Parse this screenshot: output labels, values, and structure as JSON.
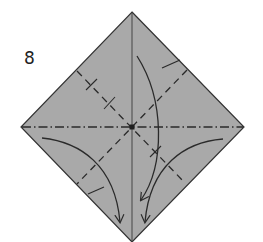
{
  "diagram": {
    "type": "origami-instruction-step",
    "step_number": "8",
    "paper": {
      "shape": "square-rotated-45",
      "fill_color": "#a9a9a9",
      "outline_color": "#333333",
      "corners": {
        "top": [
          132,
          12
        ],
        "right": [
          244,
          127
        ],
        "bottom": [
          132,
          242
        ],
        "left": [
          21,
          127
        ]
      },
      "center": [
        132,
        127
      ]
    },
    "creases": [
      {
        "name": "vertical-center-crease",
        "style": "solid-thin",
        "from": "top",
        "to": "bottom"
      },
      {
        "name": "horizontal-mountain-fold",
        "style": "dash-dot",
        "from": "left",
        "to": "right"
      },
      {
        "name": "diagonal-valley-fold-nw-se",
        "style": "dashed",
        "from": [
          77,
          71
        ],
        "to": [
          185,
          180
        ]
      },
      {
        "name": "diagonal-valley-fold-ne-sw",
        "style": "dashed",
        "from": [
          187,
          70
        ],
        "to": [
          77,
          184
        ]
      }
    ],
    "reference_ticks": [
      {
        "name": "tick-upper-left-1",
        "at": [
          91,
          84
        ]
      },
      {
        "name": "tick-upper-left-2",
        "at": [
          109,
          103
        ]
      },
      {
        "name": "tick-lower-right",
        "at": [
          155,
          152
        ]
      },
      {
        "name": "tick-upper-right-edge",
        "at": [
          172,
          66
        ]
      },
      {
        "name": "tick-lower-left-edge",
        "at": [
          95,
          190
        ]
      }
    ],
    "arrows": [
      {
        "name": "arrow-left-flap-down",
        "from": [
          42,
          138
        ],
        "to": [
          120,
          222
        ]
      },
      {
        "name": "arrow-top-flap-down",
        "from": [
          137,
          56
        ],
        "to": [
          141,
          200
        ]
      },
      {
        "name": "arrow-right-flap-down",
        "from": [
          223,
          139
        ],
        "to": [
          145,
          222
        ]
      }
    ],
    "colors": {
      "line": "#2a2a2a",
      "background": "#ffffff"
    }
  }
}
